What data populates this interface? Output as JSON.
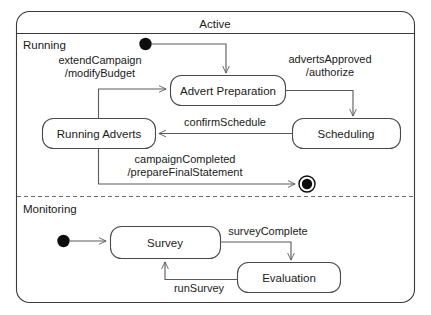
{
  "diagram": {
    "type": "uml-state-machine",
    "composite_state": {
      "name": "Active",
      "regions": [
        {
          "name": "Running",
          "states": [
            {
              "id": "advert-preparation",
              "label": "Advert Preparation"
            },
            {
              "id": "running-adverts",
              "label": "Running Adverts"
            },
            {
              "id": "scheduling",
              "label": "Scheduling"
            }
          ],
          "pseudostates": [
            {
              "id": "running-initial",
              "kind": "initial"
            },
            {
              "id": "running-final",
              "kind": "final"
            }
          ],
          "transitions": [
            {
              "from": "running-initial",
              "to": "advert-preparation",
              "label": ""
            },
            {
              "from": "advert-preparation",
              "to": "scheduling",
              "trigger": "advertsApproved",
              "effect": "/authorize",
              "label_line1": "advertsApproved",
              "label_line2": "/authorize"
            },
            {
              "from": "scheduling",
              "to": "running-adverts",
              "trigger": "confirmSchedule",
              "label_line1": "confirmSchedule",
              "label_line2": ""
            },
            {
              "from": "running-adverts",
              "to": "advert-preparation",
              "trigger": "extendCampaign",
              "effect": "/modifyBudget",
              "label_line1": "extendCampaign",
              "label_line2": "/modifyBudget"
            },
            {
              "from": "running-adverts",
              "to": "running-final",
              "trigger": "campaignCompleted",
              "effect": "/prepareFinalStatement",
              "label_line1": "campaignCompleted",
              "label_line2": "/prepareFinalStatement"
            }
          ]
        },
        {
          "name": "Monitoring",
          "states": [
            {
              "id": "survey",
              "label": "Survey"
            },
            {
              "id": "evaluation",
              "label": "Evaluation"
            }
          ],
          "pseudostates": [
            {
              "id": "monitoring-initial",
              "kind": "initial"
            }
          ],
          "transitions": [
            {
              "from": "monitoring-initial",
              "to": "survey",
              "label": ""
            },
            {
              "from": "survey",
              "to": "evaluation",
              "trigger": "surveyComplete",
              "label_line1": "surveyComplete",
              "label_line2": ""
            },
            {
              "from": "evaluation",
              "to": "survey",
              "trigger": "runSurvey",
              "label_line1": "runSurvey",
              "label_line2": ""
            }
          ]
        }
      ]
    }
  },
  "colors": {
    "background": "#ffffff",
    "frame_stroke": "#3a3a3a",
    "state_stroke": "#4a4a4a",
    "edge_stroke": "#5a5a5a",
    "node_fill": "#0d0d0d",
    "text": "#1a1a1a"
  }
}
